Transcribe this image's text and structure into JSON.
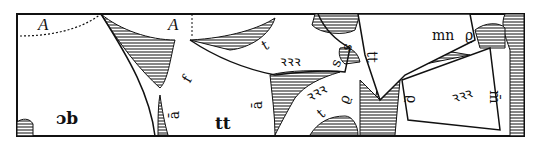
{
  "figure": {
    "type": "woodcut pattern-layout diagram",
    "colors": {
      "ink": "#111111",
      "paper": "#ffffff",
      "hatch": "#555555"
    }
  },
  "labels": {
    "A_left": "A",
    "A_mid": "A",
    "db": "ɔb",
    "f": "f",
    "a_bar_left": "ā",
    "tt_bottom": "tt",
    "a_bar_mid": "ā",
    "t_upper": "t",
    "rrr_upper": "ꝛꝛꝛ",
    "s_top": "s",
    "s_low": "s",
    "rrr_lower": "ꝛꝛꝛ",
    "t_lower": "t",
    "o_mid": "ϱ",
    "tt_right": "tt",
    "mn": "mn",
    "o_top_right": "ϱ",
    "o_lower_right": "ϱ",
    "rrr_right": "ꝛꝛꝛ",
    "m_right": "m̄"
  }
}
